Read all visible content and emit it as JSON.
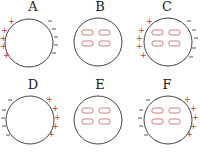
{
  "colors": {
    "outline": "#444444",
    "positive": "#d03030",
    "negative": "#555555",
    "dipole": "#c06060"
  },
  "panels": [
    {
      "id": "A",
      "label": "A",
      "left_charges": "+",
      "right_charges": "-",
      "dipoles": false
    },
    {
      "id": "B",
      "label": "B",
      "left_charges": "",
      "right_charges": "",
      "dipoles": true
    },
    {
      "id": "C",
      "label": "C",
      "left_charges": "+",
      "right_charges": "-",
      "dipoles": true
    },
    {
      "id": "D",
      "label": "D",
      "left_charges": "-",
      "right_charges": "+",
      "dipoles": false
    },
    {
      "id": "E",
      "label": "E",
      "left_charges": "",
      "right_charges": "",
      "dipoles": true
    },
    {
      "id": "F",
      "label": "F",
      "left_charges": "-",
      "right_charges": "+",
      "dipoles": true
    }
  ]
}
